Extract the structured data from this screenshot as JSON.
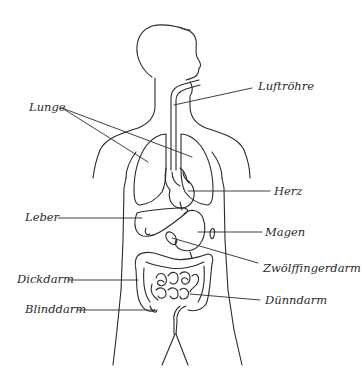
{
  "diagram": {
    "type": "anatomy-diagram",
    "line_color": "#2a2a2a",
    "background": "#ffffff",
    "labels": [
      {
        "id": "lunge",
        "text": "Lunge",
        "x": 29,
        "y": 102
      },
      {
        "id": "luftroehre",
        "text": "Luftröhre",
        "x": 258,
        "y": 81
      },
      {
        "id": "herz",
        "text": "Herz",
        "x": 274,
        "y": 186
      },
      {
        "id": "leber",
        "text": "Leber",
        "x": 25,
        "y": 212
      },
      {
        "id": "magen",
        "text": "Magen",
        "x": 265,
        "y": 227
      },
      {
        "id": "zwoelffingerdarm",
        "text": "Zwölffingerdarm",
        "x": 263,
        "y": 263
      },
      {
        "id": "dickdarm",
        "text": "Dickdarm",
        "x": 17,
        "y": 274
      },
      {
        "id": "duenndarm",
        "text": "Dünndarm",
        "x": 265,
        "y": 295
      },
      {
        "id": "blinddarm",
        "text": "Blinddarm",
        "x": 25,
        "y": 304
      }
    ]
  }
}
